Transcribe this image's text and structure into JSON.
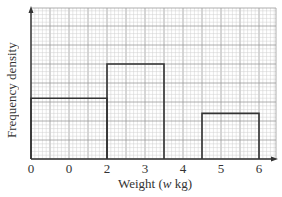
{
  "chart_data": {
    "type": "bar",
    "subtype": "histogram",
    "title": "",
    "xlabel": "Weight (w kg)",
    "xlabel_parts": {
      "pre": "Weight (",
      "var": "w",
      "post": " kg)"
    },
    "ylabel": "Frequency density",
    "x_tick_labels": [
      "0",
      "0",
      "2",
      "3",
      "4",
      "5",
      "6"
    ],
    "x_tick_positions": [
      0,
      1,
      2,
      3,
      4,
      5,
      6
    ],
    "y_tick_labels": [],
    "xlim": [
      0,
      6.4
    ],
    "grid": true,
    "grid_note": "graph paper: major lines every 0.5 units horizontally, 5 minor divisions each",
    "bars": [
      {
        "x_start": 0,
        "x_end": 2,
        "height_minor_squares": 16
      },
      {
        "x_start": 2,
        "x_end": 3.5,
        "height_minor_squares": 25
      },
      {
        "x_start": 4.5,
        "x_end": 6,
        "height_minor_squares": 12
      }
    ],
    "y_units": "minor grid squares (no numeric y-axis labels shown)",
    "legend": null
  },
  "colors": {
    "minor_grid": "#cfcfcf",
    "major_grid": "#9a9a9a",
    "bar_outline": "#333333",
    "axis": "#333333",
    "background": "#ffffff"
  }
}
